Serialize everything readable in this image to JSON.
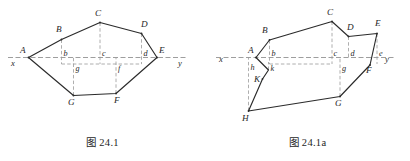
{
  "page": {
    "width": 410,
    "height": 161,
    "background": "#ffffff",
    "stroke_color": "#2b2b2b",
    "axis_color": "#8d8d8d",
    "guide_color": "#9a9a9a"
  },
  "figures": [
    {
      "id": "figure-24-1",
      "caption": "图 24.1",
      "axis": {
        "left_label": "x",
        "right_label": "y",
        "y": 57.5,
        "x_start": 8,
        "x_end": 188,
        "left_label_pos": {
          "x": 11,
          "y": 66
        },
        "right_label_pos": {
          "x": 178,
          "y": 66
        }
      },
      "vertices": [
        {
          "name": "A",
          "x": 28.5,
          "y": 57.5,
          "label": "A",
          "label_x": 20,
          "label_y": 53
        },
        {
          "name": "B",
          "x": 61.5,
          "y": 39.5,
          "label": "B",
          "label_x": 56,
          "label_y": 32
        },
        {
          "name": "C",
          "x": 100.0,
          "y": 22.5,
          "label": "C",
          "label_x": 95,
          "label_y": 16
        },
        {
          "name": "D",
          "x": 141.5,
          "y": 33.5,
          "label": "D",
          "label_x": 141,
          "label_y": 27
        },
        {
          "name": "E",
          "x": 157.0,
          "y": 57.5,
          "label": "E",
          "label_x": 159,
          "label_y": 53
        },
        {
          "name": "F",
          "x": 116.0,
          "y": 93.5,
          "label": "F",
          "label_x": 114,
          "label_y": 103
        },
        {
          "name": "G",
          "x": 73.5,
          "y": 95.5,
          "label": "G",
          "label_x": 68,
          "label_y": 105
        }
      ],
      "outline": "28.5,57.5 61.5,39.5 100,22.5 141.5,33.5 157,57.5 116,93.5 73.5,95.5 28.5,57.5",
      "guides": [
        {
          "name": "guide-b",
          "x1": 61.5,
          "y1": 39.5,
          "x2": 61.5,
          "y2": 64
        },
        {
          "name": "guide-c",
          "x1": 100.0,
          "y1": 22.5,
          "x2": 100.0,
          "y2": 64
        },
        {
          "name": "guide-d",
          "x1": 141.5,
          "y1": 33.5,
          "x2": 141.5,
          "y2": 64
        },
        {
          "name": "guide-g",
          "x1": 73.5,
          "y1": 95.5,
          "x2": 73.5,
          "y2": 57.5
        },
        {
          "name": "guide-f",
          "x1": 116.0,
          "y1": 93.5,
          "x2": 116.0,
          "y2": 57.5
        },
        {
          "name": "guide-lower-axis",
          "x1": 61.5,
          "y1": 64,
          "x2": 141.5,
          "y2": 64
        }
      ],
      "foot_labels": [
        {
          "name": "b",
          "label": "b",
          "x": 63.5,
          "y": 56
        },
        {
          "name": "c",
          "label": "c",
          "x": 102,
          "y": 56
        },
        {
          "name": "d",
          "label": "d",
          "x": 143.5,
          "y": 56
        },
        {
          "name": "g",
          "label": "g",
          "x": 75.5,
          "y": 71
        },
        {
          "name": "f",
          "label": "f",
          "x": 118,
          "y": 71
        }
      ]
    },
    {
      "id": "figure-24-1a",
      "caption": "图 24.1a",
      "axis": {
        "left_label": "x",
        "right_label": "y",
        "y": 57.5,
        "x_start": 11,
        "x_end": 190,
        "left_label_pos": {
          "x": 14,
          "y": 61.5
        },
        "right_label_pos": {
          "x": 180,
          "y": 62
        }
      },
      "vertices": [
        {
          "name": "A",
          "x": 51.0,
          "y": 57.5,
          "label": "A",
          "label_x": 43,
          "label_y": 52.5
        },
        {
          "name": "B",
          "x": 64.5,
          "y": 40.0,
          "label": "B",
          "label_x": 57,
          "label_y": 33
        },
        {
          "name": "C",
          "x": 127.0,
          "y": 21.5,
          "label": "C",
          "label_x": 122,
          "label_y": 15
        },
        {
          "name": "D",
          "x": 143.5,
          "y": 36.5,
          "label": "D",
          "label_x": 142,
          "label_y": 30
        },
        {
          "name": "E",
          "x": 172.0,
          "y": 33.5,
          "label": "E",
          "label_x": 170,
          "label_y": 26
        },
        {
          "name": "F",
          "x": 165.0,
          "y": 65.0,
          "label": "F",
          "label_x": 161,
          "label_y": 73
        },
        {
          "name": "G",
          "x": 135.0,
          "y": 96.5,
          "label": "G",
          "label_x": 130,
          "label_y": 106
        },
        {
          "name": "H",
          "x": 43.5,
          "y": 111.0,
          "label": "H",
          "label_x": 37,
          "label_y": 121
        },
        {
          "name": "K",
          "x": 57.5,
          "y": 79.0,
          "label": "K",
          "label_x": 49,
          "label_y": 82
        }
      ],
      "outline": "51,57.5 64.5,40 127,21.5 143.5,36.5 172,33.5 165,65 135,96.5 43.5,111 57.5,79 63.5,70 51,57.5",
      "guides": [
        {
          "name": "guide-b",
          "x1": 64.5,
          "y1": 40.0,
          "x2": 64.5,
          "y2": 64
        },
        {
          "name": "guide-c",
          "x1": 127.0,
          "y1": 21.5,
          "x2": 127.0,
          "y2": 64
        },
        {
          "name": "guide-d",
          "x1": 143.5,
          "y1": 36.5,
          "x2": 143.5,
          "y2": 57.5
        },
        {
          "name": "guide-e",
          "x1": 172.0,
          "y1": 33.5,
          "x2": 172.0,
          "y2": 64
        },
        {
          "name": "guide-h",
          "x1": 43.5,
          "y1": 111.0,
          "x2": 43.5,
          "y2": 57.5
        },
        {
          "name": "guide-g",
          "x1": 135.0,
          "y1": 96.5,
          "x2": 135.0,
          "y2": 57.5
        },
        {
          "name": "guide-k",
          "x1": 63.5,
          "y1": 70.0,
          "x2": 63.5,
          "y2": 62
        },
        {
          "name": "guide-mid-axis",
          "x1": 64.5,
          "y1": 64,
          "x2": 127,
          "y2": 64
        }
      ],
      "foot_labels": [
        {
          "name": "b",
          "label": "b",
          "x": 66.5,
          "y": 55.5
        },
        {
          "name": "c",
          "label": "c",
          "x": 128.5,
          "y": 55.5
        },
        {
          "name": "d",
          "label": "d",
          "x": 145.5,
          "y": 55.5
        },
        {
          "name": "e",
          "label": "e",
          "x": 174,
          "y": 55.5
        },
        {
          "name": "h",
          "label": "h",
          "x": 45.5,
          "y": 70
        },
        {
          "name": "k",
          "label": "k",
          "x": 65.5,
          "y": 71
        },
        {
          "name": "g",
          "label": "g",
          "x": 137,
          "y": 71
        }
      ]
    }
  ]
}
